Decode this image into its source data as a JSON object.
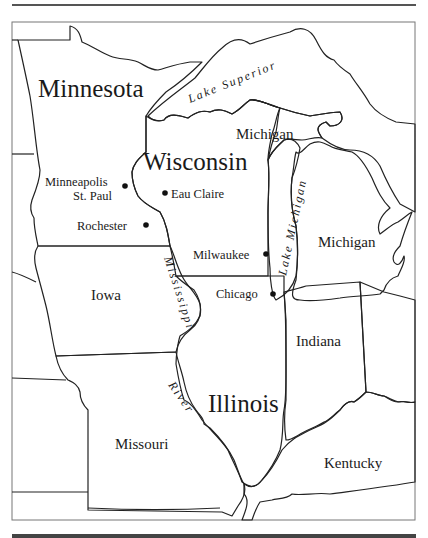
{
  "map": {
    "colors": {
      "minnesota": "#c9c9c9",
      "wisconsin": "#b5b5b5",
      "illinois": "#9b9b9b",
      "lakes": "#dedede",
      "other_states": "#ffffff",
      "border": "#222222"
    },
    "states": {
      "minnesota": "Minnesota",
      "wisconsin": "Wisconsin",
      "illinois": "Illinois",
      "iowa": "Iowa",
      "missouri": "Missouri",
      "indiana": "Indiana",
      "kentucky": "Kentucky",
      "michigan_upper": "Michigan",
      "michigan_lower": "Michigan"
    },
    "cities": {
      "minneapolis": "Minneapolis",
      "st_paul": "St. Paul",
      "rochester": "Rochester",
      "eau_claire": "Eau Claire",
      "milwaukee": "Milwaukee",
      "chicago": "Chicago"
    },
    "water": {
      "lake_superior": "Lake Superior",
      "lake_michigan": "Lake Michigan",
      "mississippi": "Mississippi",
      "river": "River"
    }
  }
}
